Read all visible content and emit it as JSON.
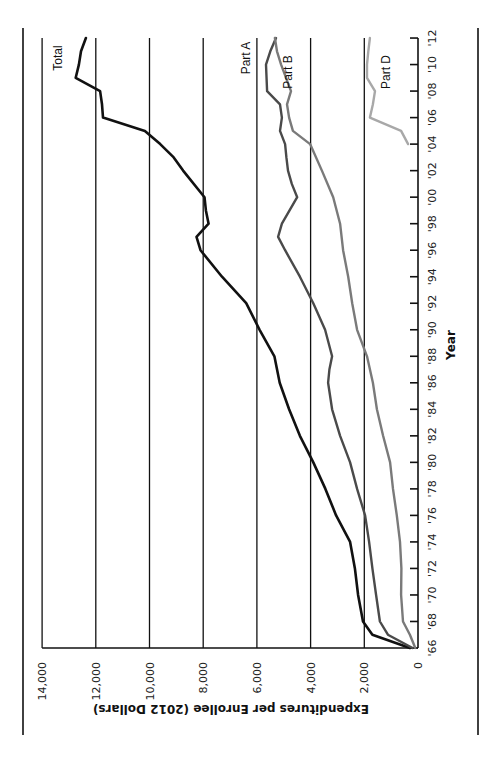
{
  "chart_data": {
    "type": "line",
    "orientation": "rotated-90-counterclockwise",
    "title": "",
    "xlabel": "Year",
    "ylabel": "Expenditures per Enrollee (2012 Dollars)",
    "ylim": [
      0,
      14000
    ],
    "xlim": [
      1966,
      2012
    ],
    "grid": true,
    "y_ticks": [
      0,
      2000,
      4000,
      6000,
      8000,
      10000,
      12000,
      14000
    ],
    "y_tick_labels": [
      "0",
      "2,000",
      "4,000",
      "6,000",
      "8,000",
      "10,000",
      "12,000",
      "14,000"
    ],
    "x_ticks": [
      1966,
      1968,
      1970,
      1972,
      1974,
      1976,
      1978,
      1980,
      1982,
      1984,
      1986,
      1988,
      1990,
      1992,
      1994,
      1996,
      1998,
      2000,
      2002,
      2004,
      2006,
      2008,
      2010,
      2012
    ],
    "x_tick_labels": [
      "'66",
      "'68",
      "'70",
      "'72",
      "'74",
      "'76",
      "'78",
      "'80",
      "'82",
      "'84",
      "'86",
      "'88",
      "'90",
      "'92",
      "'94",
      "'96",
      "'98",
      "'00",
      "'02",
      "'04",
      "'06",
      "'08",
      "'10",
      "'12"
    ],
    "series": [
      {
        "name": "Total",
        "color": "#111111",
        "width": 2.6,
        "points": [
          [
            1966,
            300
          ],
          [
            1967,
            1700
          ],
          [
            1968,
            2050
          ],
          [
            1970,
            2230
          ],
          [
            1972,
            2350
          ],
          [
            1974,
            2530
          ],
          [
            1976,
            3050
          ],
          [
            1978,
            3450
          ],
          [
            1980,
            3900
          ],
          [
            1982,
            4400
          ],
          [
            1984,
            4800
          ],
          [
            1986,
            5150
          ],
          [
            1988,
            5350
          ],
          [
            1990,
            5900
          ],
          [
            1992,
            6400
          ],
          [
            1994,
            7300
          ],
          [
            1996,
            8100
          ],
          [
            1997,
            8250
          ],
          [
            1998,
            7800
          ],
          [
            1999,
            7900
          ],
          [
            2000,
            7950
          ],
          [
            2002,
            8750
          ],
          [
            2003,
            9100
          ],
          [
            2004,
            9600
          ],
          [
            2005,
            10170
          ],
          [
            2006,
            11730
          ],
          [
            2007,
            11770
          ],
          [
            2008,
            11840
          ],
          [
            2009,
            12750
          ],
          [
            2010,
            12630
          ],
          [
            2011,
            12550
          ],
          [
            2012,
            12370
          ]
        ]
      },
      {
        "name": "Part A",
        "color": "#4a4a4a",
        "width": 2.4,
        "points": [
          [
            1966,
            200
          ],
          [
            1967,
            1120
          ],
          [
            1968,
            1420
          ],
          [
            1970,
            1560
          ],
          [
            1972,
            1700
          ],
          [
            1974,
            1820
          ],
          [
            1976,
            1970
          ],
          [
            1978,
            2270
          ],
          [
            1980,
            2530
          ],
          [
            1982,
            2900
          ],
          [
            1984,
            3200
          ],
          [
            1986,
            3350
          ],
          [
            1987,
            3300
          ],
          [
            1988,
            3200
          ],
          [
            1990,
            3460
          ],
          [
            1992,
            3900
          ],
          [
            1994,
            4400
          ],
          [
            1996,
            4950
          ],
          [
            1997,
            5210
          ],
          [
            1998,
            5070
          ],
          [
            2000,
            4500
          ],
          [
            2001,
            4700
          ],
          [
            2002,
            4840
          ],
          [
            2003,
            4900
          ],
          [
            2004,
            4950
          ],
          [
            2005,
            5140
          ],
          [
            2006,
            5070
          ],
          [
            2007,
            5140
          ],
          [
            2008,
            5620
          ],
          [
            2010,
            5660
          ],
          [
            2011,
            5500
          ],
          [
            2012,
            5290
          ]
        ]
      },
      {
        "name": "Part B",
        "color": "#7a7a7a",
        "width": 2.4,
        "points": [
          [
            1966,
            100
          ],
          [
            1967,
            300
          ],
          [
            1968,
            560
          ],
          [
            1970,
            630
          ],
          [
            1972,
            620
          ],
          [
            1974,
            670
          ],
          [
            1976,
            790
          ],
          [
            1978,
            930
          ],
          [
            1980,
            1040
          ],
          [
            1982,
            1300
          ],
          [
            1984,
            1530
          ],
          [
            1986,
            1680
          ],
          [
            1988,
            1900
          ],
          [
            1990,
            2270
          ],
          [
            1992,
            2450
          ],
          [
            1994,
            2600
          ],
          [
            1996,
            2790
          ],
          [
            1998,
            2900
          ],
          [
            2000,
            3160
          ],
          [
            2002,
            3580
          ],
          [
            2004,
            4020
          ],
          [
            2005,
            4660
          ],
          [
            2006,
            4800
          ],
          [
            2007,
            4880
          ],
          [
            2008,
            4730
          ],
          [
            2010,
            5100
          ],
          [
            2011,
            5250
          ],
          [
            2012,
            5330
          ]
        ]
      },
      {
        "name": "Part D",
        "color": "#a8a8a8",
        "width": 2.4,
        "points": [
          [
            2004,
            370
          ],
          [
            2005,
            630
          ],
          [
            2006,
            1790
          ],
          [
            2007,
            1680
          ],
          [
            2008,
            1600
          ],
          [
            2009,
            1900
          ],
          [
            2010,
            1900
          ],
          [
            2011,
            1850
          ],
          [
            2012,
            1790
          ]
        ]
      }
    ],
    "annotations": [
      {
        "text": "Total",
        "series": "Total"
      },
      {
        "text": "Part A",
        "series": "Part A"
      },
      {
        "text": "Part B",
        "series": "Part B"
      },
      {
        "text": "Part D",
        "series": "Part D"
      }
    ],
    "legend_position": "inline-labels"
  },
  "layout": {
    "x0": 418,
    "px_per_value": 0.02685,
    "y0": 648,
    "px_per_year": 13.26,
    "label_positions": {
      "Total": [
        62,
        58
      ],
      "Part A": [
        250,
        58
      ],
      "Part B": [
        292,
        72
      ],
      "Part D": [
        390,
        72
      ]
    }
  }
}
